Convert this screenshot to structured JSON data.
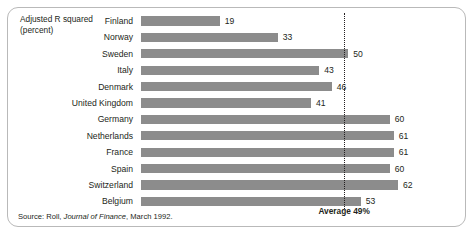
{
  "chart_data": {
    "type": "bar",
    "orientation": "horizontal",
    "title": "",
    "xlabel": "",
    "ylabel": "Adjusted R squared (percent)",
    "categories": [
      "Finland",
      "Norway",
      "Sweden",
      "Italy",
      "Denmark",
      "United Kingdom",
      "Germany",
      "Netherlands",
      "France",
      "Spain",
      "Switzerland",
      "Belgium"
    ],
    "values": [
      19,
      33,
      50,
      43,
      46,
      41,
      60,
      61,
      61,
      60,
      62,
      53
    ],
    "value_labels": [
      "19",
      "33",
      "50",
      "43",
      "46",
      "41",
      "60",
      "61",
      "61",
      "60",
      "62",
      "53"
    ],
    "xlim": [
      0,
      70
    ],
    "grid": false,
    "legend": null,
    "annotations": [
      {
        "name": "average-reference-line",
        "label": "Average 49%",
        "value": 49,
        "style": "dotted-vertical"
      }
    ],
    "series": [
      {
        "name": "Adjusted R squared (percent)",
        "values": [
          19,
          33,
          50,
          43,
          46,
          41,
          60,
          61,
          61,
          60,
          62,
          53
        ],
        "color": "#8c8c8c"
      }
    ]
  },
  "axis_title": {
    "line1": "Adjusted R squared",
    "line2": "(percent)",
    "text": "Adjusted R squared\n(percent)"
  },
  "average": {
    "label": "Average 49%",
    "value": 49
  },
  "source": {
    "prefix": "Source: Roll, ",
    "journal": "Journal of Finance",
    "suffix": ", March 1992.",
    "full": "Source: Roll, Journal of Finance, March 1992."
  },
  "colors": {
    "bar": "#8c8c8c",
    "text": "#231f20",
    "panel_border": "#b9b9b9",
    "background": "#ffffff"
  }
}
